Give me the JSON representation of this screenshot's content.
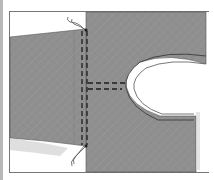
{
  "illustration": {
    "subject": "sewing diagram: sleeve joined to bodice with stitching lines and armhole/neck curve",
    "colors": {
      "fabric": "#8f8f8f",
      "fabric_light": "#a3a3a3",
      "stitch": "#1e1e1e",
      "background": "#ffffff",
      "frame": "#777777"
    }
  }
}
